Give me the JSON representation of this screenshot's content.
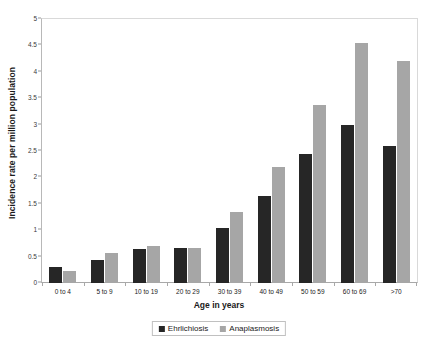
{
  "chart_data": {
    "type": "bar",
    "title": "",
    "subtitle": "",
    "xlabel": "Age in years",
    "ylabel": "Incidence rate per million population",
    "categories": [
      "0 to 4",
      "5 to 9",
      "10 to 19",
      "20 to 29",
      "30 to 39",
      "40 to 49",
      "50 to 59",
      "60 to 69",
      ">70"
    ],
    "series": [
      {
        "name": "Ehrlichiosis",
        "color": "#262626",
        "values": [
          0.3,
          0.43,
          0.65,
          0.67,
          1.05,
          1.65,
          2.45,
          3.0,
          2.6
        ]
      },
      {
        "name": "Anaplasmosis",
        "color": "#a6a6a6",
        "values": [
          0.22,
          0.57,
          0.7,
          0.67,
          1.35,
          2.2,
          3.38,
          4.55,
          4.2
        ]
      }
    ],
    "ylim": [
      0,
      5
    ],
    "ytick_values": [
      0,
      0.5,
      1,
      1.5,
      2,
      2.5,
      3,
      3.5,
      4,
      4.5,
      5
    ],
    "ytick_labels": [
      "0",
      "0.5",
      "1",
      "1.5",
      "2",
      "2.5",
      "3",
      "3.5",
      "4",
      "4.5",
      "5"
    ],
    "grid": false,
    "legend_position": "bottom",
    "orientation": "vertical",
    "bar_mode": "grouped"
  }
}
